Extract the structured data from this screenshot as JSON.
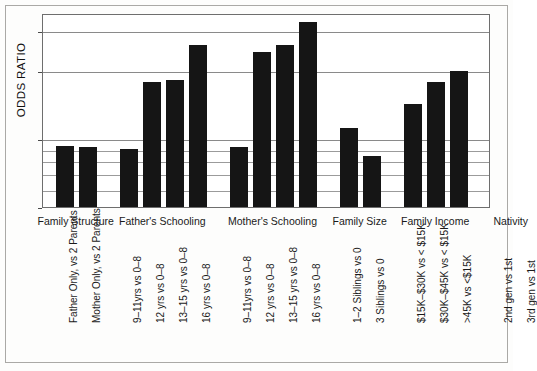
{
  "chart_data": {
    "type": "bar",
    "title": "",
    "xlabel": "",
    "ylabel": "ODDS RATIO",
    "yscale": "log",
    "ylim": [
      0.5,
      3.6
    ],
    "grid": true,
    "legend": "none",
    "y_ticks": [
      {
        "value": 3,
        "label": "3",
        "major": true
      },
      {
        "value": 2,
        "label": "2",
        "major": true
      },
      {
        "value": 1,
        "label": "1",
        "major": true
      },
      {
        "value": 0.9,
        "label": "",
        "major": false
      },
      {
        "value": 0.8,
        "label": "",
        "major": false
      },
      {
        "value": 0.7,
        "label": "",
        "major": false
      },
      {
        "value": 0.6,
        "label": "",
        "major": false
      },
      {
        "value": 0.5,
        "label": "0.5",
        "major": true
      }
    ],
    "groups": [
      {
        "name": "Family Structure",
        "bars": [
          {
            "label": "Father Only, vs 2 Parents",
            "value": 0.93
          },
          {
            "label": "Mother Only, vs 2 Parents",
            "value": 0.92
          }
        ]
      },
      {
        "name": "Father's Schooling",
        "bars": [
          {
            "label": "9–11yrs vs 0–8",
            "value": 0.9
          },
          {
            "label": "12 yrs vs 0–8",
            "value": 1.78
          },
          {
            "label": "13–15 yrs vs 0–8",
            "value": 1.82
          },
          {
            "label": "16 yrs vs 0–8",
            "value": 2.6
          }
        ]
      },
      {
        "name": "Mother's Schooling",
        "bars": [
          {
            "label": "9–11yrs vs 0–8",
            "value": 0.92
          },
          {
            "label": "12 yrs vs 0–8",
            "value": 2.42
          },
          {
            "label": "13–15 yrs vs 0–8",
            "value": 2.6
          },
          {
            "label": "16 yrs vs 0–8",
            "value": 3.3
          }
        ]
      },
      {
        "name": "Family Size",
        "bars": [
          {
            "label": "1–2 Siblings vs 0",
            "value": 1.12
          },
          {
            "label": "3 Siblings vs 0",
            "value": 0.84
          }
        ]
      },
      {
        "name": "Family Income",
        "bars": [
          {
            "label": "$15K–$30K vs < $15K",
            "value": 1.42
          },
          {
            "label": "$30K–$45K vs < $15K",
            "value": 1.78
          },
          {
            "label": ">45K vs <$15K",
            "value": 2.0
          }
        ]
      },
      {
        "name": "Nativity",
        "bars": [
          {
            "label": "2nd gen vs 1st",
            "value": 1.3
          },
          {
            "label": "3rd gen vs 1st",
            "value": 0.75
          }
        ]
      }
    ],
    "colors": {
      "bar": "#151515",
      "grid": "#8a8a8a",
      "frame": "#6e6e6e",
      "page_border": "#aaa9a6",
      "background": "#ffffff"
    }
  }
}
